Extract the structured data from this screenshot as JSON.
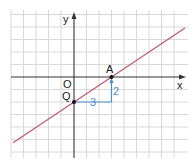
{
  "diagram": {
    "type": "coordinate-grid",
    "axes": {
      "x_label": "x",
      "y_label": "y",
      "origin_label": "O"
    },
    "points": [
      {
        "name": "Q",
        "label": "Q",
        "coords": [
          0,
          -2
        ]
      },
      {
        "name": "A",
        "label": "A",
        "coords": [
          3,
          0
        ]
      }
    ],
    "line": {
      "color": "#c0506a",
      "slope": "2/3",
      "through": [
        "Q",
        "A"
      ]
    },
    "slope_triangle": {
      "color": "#4a8fc9",
      "run_label": "3",
      "rise_label": "2"
    },
    "colors": {
      "grid": "#d8d8d8",
      "axis": "#333333",
      "line": "#c0506a",
      "step": "#4a8fc9"
    }
  }
}
